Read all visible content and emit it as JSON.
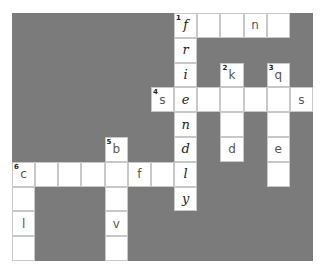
{
  "puzzle": {
    "rows": 10,
    "cols": 13,
    "colors": {
      "block": "#7b7b7b",
      "cell": "#ffffff",
      "border": "#c8c8c8"
    },
    "key_column": 7,
    "cells": [
      {
        "r": 0,
        "c": 7,
        "num": "1",
        "letter": "f",
        "key": true
      },
      {
        "r": 0,
        "c": 8,
        "num": "",
        "letter": ""
      },
      {
        "r": 0,
        "c": 9,
        "num": "",
        "letter": ""
      },
      {
        "r": 0,
        "c": 10,
        "num": "",
        "letter": "n"
      },
      {
        "r": 0,
        "c": 11,
        "num": "",
        "letter": ""
      },
      {
        "r": 1,
        "c": 7,
        "num": "",
        "letter": "r",
        "key": true
      },
      {
        "r": 2,
        "c": 7,
        "num": "",
        "letter": "i",
        "key": true
      },
      {
        "r": 2,
        "c": 9,
        "num": "2",
        "letter": "k"
      },
      {
        "r": 2,
        "c": 11,
        "num": "3",
        "letter": "q"
      },
      {
        "r": 3,
        "c": 6,
        "num": "4",
        "letter": "s"
      },
      {
        "r": 3,
        "c": 7,
        "num": "",
        "letter": "e",
        "key": true
      },
      {
        "r": 3,
        "c": 8,
        "num": "",
        "letter": ""
      },
      {
        "r": 3,
        "c": 9,
        "num": "",
        "letter": ""
      },
      {
        "r": 3,
        "c": 10,
        "num": "",
        "letter": ""
      },
      {
        "r": 3,
        "c": 11,
        "num": "",
        "letter": ""
      },
      {
        "r": 3,
        "c": 12,
        "num": "",
        "letter": "s"
      },
      {
        "r": 4,
        "c": 7,
        "num": "",
        "letter": "n",
        "key": true
      },
      {
        "r": 4,
        "c": 9,
        "num": "",
        "letter": ""
      },
      {
        "r": 4,
        "c": 11,
        "num": "",
        "letter": ""
      },
      {
        "r": 5,
        "c": 4,
        "num": "5",
        "letter": "b"
      },
      {
        "r": 5,
        "c": 7,
        "num": "",
        "letter": "d",
        "key": true
      },
      {
        "r": 5,
        "c": 9,
        "num": "",
        "letter": "d"
      },
      {
        "r": 5,
        "c": 11,
        "num": "",
        "letter": "e"
      },
      {
        "r": 6,
        "c": 0,
        "num": "6",
        "letter": "c"
      },
      {
        "r": 6,
        "c": 1,
        "num": "",
        "letter": ""
      },
      {
        "r": 6,
        "c": 2,
        "num": "",
        "letter": ""
      },
      {
        "r": 6,
        "c": 3,
        "num": "",
        "letter": ""
      },
      {
        "r": 6,
        "c": 4,
        "num": "",
        "letter": ""
      },
      {
        "r": 6,
        "c": 5,
        "num": "",
        "letter": "f"
      },
      {
        "r": 6,
        "c": 6,
        "num": "",
        "letter": ""
      },
      {
        "r": 6,
        "c": 7,
        "num": "",
        "letter": "l",
        "key": true
      },
      {
        "r": 6,
        "c": 11,
        "num": "",
        "letter": ""
      },
      {
        "r": 7,
        "c": 0,
        "num": "",
        "letter": ""
      },
      {
        "r": 7,
        "c": 4,
        "num": "",
        "letter": ""
      },
      {
        "r": 7,
        "c": 7,
        "num": "",
        "letter": "y",
        "key": true
      },
      {
        "r": 8,
        "c": 0,
        "num": "",
        "letter": "l"
      },
      {
        "r": 8,
        "c": 4,
        "num": "",
        "letter": "v"
      },
      {
        "r": 9,
        "c": 0,
        "num": "",
        "letter": ""
      },
      {
        "r": 9,
        "c": 4,
        "num": "",
        "letter": ""
      }
    ]
  }
}
